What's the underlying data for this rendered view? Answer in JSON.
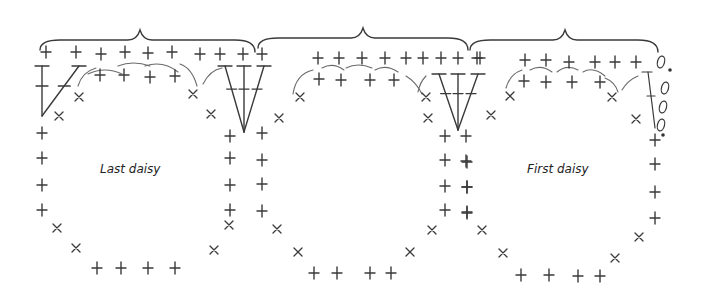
{
  "labels": [
    {
      "id": "last-daisy",
      "text": "Last daisy",
      "x": 100,
      "y": 162
    },
    {
      "id": "first-daisy",
      "text": "First daisy",
      "x": 527,
      "y": 162
    }
  ],
  "braces": [
    {
      "x1": 40,
      "x2": 255,
      "peak": 140,
      "y": 38
    },
    {
      "x1": 258,
      "x2": 468,
      "peak": 363,
      "y": 36
    },
    {
      "x1": 470,
      "x2": 658,
      "peak": 565,
      "y": 38
    }
  ],
  "plus": [
    [
      46,
      52
    ],
    [
      76,
      52
    ],
    [
      101,
      54
    ],
    [
      125,
      52
    ],
    [
      148,
      53
    ],
    [
      172,
      52
    ],
    [
      200,
      54
    ],
    [
      220,
      54
    ],
    [
      243,
      54
    ],
    [
      100,
      75
    ],
    [
      124,
      75
    ],
    [
      150,
      77
    ],
    [
      175,
      76
    ],
    [
      42,
      133
    ],
    [
      42,
      158
    ],
    [
      42,
      185
    ],
    [
      42,
      210
    ],
    [
      97,
      268
    ],
    [
      121,
      268
    ],
    [
      148,
      268
    ],
    [
      175,
      268
    ],
    [
      230,
      136
    ],
    [
      230,
      158
    ],
    [
      230,
      185
    ],
    [
      230,
      210
    ],
    [
      262,
      54
    ],
    [
      262,
      133
    ],
    [
      262,
      160
    ],
    [
      262,
      184
    ],
    [
      262,
      211
    ],
    [
      318,
      58
    ],
    [
      339,
      58
    ],
    [
      362,
      58
    ],
    [
      385,
      58
    ],
    [
      406,
      58
    ],
    [
      423,
      58
    ],
    [
      441,
      58
    ],
    [
      458,
      58
    ],
    [
      480,
      58
    ],
    [
      319,
      79
    ],
    [
      341,
      80
    ],
    [
      370,
      80
    ],
    [
      394,
      80
    ],
    [
      445,
      136
    ],
    [
      445,
      160
    ],
    [
      445,
      186
    ],
    [
      445,
      210
    ],
    [
      466,
      136
    ],
    [
      466,
      161
    ],
    [
      467,
      187
    ],
    [
      467,
      213
    ],
    [
      314,
      273
    ],
    [
      337,
      273
    ],
    [
      370,
      273
    ],
    [
      391,
      273
    ],
    [
      477,
      58
    ],
    [
      525,
      60
    ],
    [
      546,
      60
    ],
    [
      569,
      62
    ],
    [
      595,
      62
    ],
    [
      615,
      62
    ],
    [
      636,
      62
    ],
    [
      524,
      81
    ],
    [
      546,
      82
    ],
    [
      572,
      82
    ],
    [
      600,
      82
    ],
    [
      655,
      140
    ],
    [
      655,
      164
    ],
    [
      655,
      192
    ],
    [
      655,
      218
    ],
    [
      467,
      162
    ],
    [
      467,
      187
    ],
    [
      467,
      212
    ],
    [
      521,
      275
    ],
    [
      549,
      275
    ],
    [
      578,
      276
    ],
    [
      600,
      276
    ]
  ],
  "crosses": [
    [
      79,
      97
    ],
    [
      59,
      116
    ],
    [
      193,
      94
    ],
    [
      211,
      114
    ],
    [
      229,
      225
    ],
    [
      214,
      250
    ],
    [
      300,
      97
    ],
    [
      279,
      118
    ],
    [
      426,
      97
    ],
    [
      428,
      118
    ],
    [
      432,
      230
    ],
    [
      410,
      252
    ],
    [
      510,
      96
    ],
    [
      491,
      115
    ],
    [
      612,
      97
    ],
    [
      636,
      119
    ],
    [
      639,
      237
    ],
    [
      615,
      258
    ],
    [
      57,
      228
    ],
    [
      76,
      248
    ],
    [
      277,
      229
    ],
    [
      298,
      252
    ],
    [
      482,
      230
    ],
    [
      503,
      253
    ]
  ],
  "chains": [
    [
      661,
      62
    ],
    [
      665,
      88
    ],
    [
      663,
      107
    ],
    [
      661,
      125
    ]
  ],
  "dots": [
    [
      670,
      70
    ],
    [
      663,
      135
    ]
  ],
  "fans": [
    {
      "apex": [
        244,
        132
      ],
      "tops": [
        [
          225,
          66
        ],
        [
          244,
          66
        ],
        [
          264,
          66
        ]
      ]
    },
    {
      "apex": [
        458,
        130
      ],
      "tops": [
        [
          439,
          74
        ],
        [
          458,
          74
        ],
        [
          478,
          74
        ]
      ]
    }
  ],
  "singleSticks": [
    {
      "top": [
        42,
        66
      ],
      "bottom": [
        42,
        116
      ]
    },
    {
      "top": [
        79,
        66
      ],
      "bottom": [
        42,
        116
      ]
    }
  ],
  "arcs": [
    [
      88,
      74,
      105,
      66,
      122,
      74
    ],
    [
      118,
      66,
      133,
      60,
      150,
      66
    ],
    [
      145,
      66,
      163,
      60,
      178,
      72
    ],
    [
      180,
      64,
      192,
      68,
      197,
      86
    ],
    [
      203,
      84,
      210,
      70,
      222,
      68
    ],
    [
      78,
      86,
      82,
      72,
      96,
      68
    ],
    [
      293,
      94,
      296,
      74,
      313,
      70
    ],
    [
      322,
      68,
      333,
      62,
      344,
      70
    ],
    [
      346,
      68,
      358,
      62,
      372,
      68
    ],
    [
      375,
      70,
      386,
      64,
      398,
      72
    ],
    [
      406,
      76,
      416,
      82,
      422,
      94
    ],
    [
      418,
      92,
      420,
      82,
      426,
      76
    ],
    [
      506,
      88,
      510,
      74,
      522,
      70
    ],
    [
      530,
      70,
      541,
      64,
      552,
      72
    ],
    [
      557,
      72,
      567,
      64,
      578,
      70
    ],
    [
      583,
      72,
      593,
      66,
      605,
      76
    ],
    [
      605,
      78,
      615,
      82,
      618,
      92
    ],
    [
      622,
      90,
      628,
      80,
      638,
      76
    ]
  ]
}
